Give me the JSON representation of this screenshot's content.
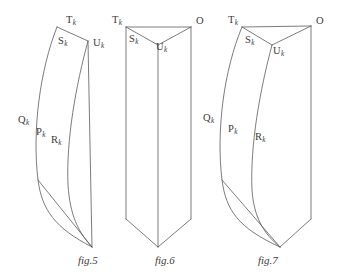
{
  "page": {
    "width": 343,
    "height": 280,
    "background": "#ffffff",
    "stroke_color": "#5a5a5a",
    "text_color": "#3b3b3b"
  },
  "figures": [
    {
      "caption": "fig.5",
      "caption_pos": {
        "x": 78,
        "y": 255
      },
      "description": "curved tapering prism converging to a point at the bottom",
      "labels": [
        {
          "name": "T",
          "sub": "k",
          "x": 66,
          "y": 15
        },
        {
          "name": "S",
          "sub": "k",
          "x": 58,
          "y": 36
        },
        {
          "name": "U",
          "sub": "k",
          "x": 93,
          "y": 38
        },
        {
          "name": "Q",
          "sub": "k",
          "x": 18,
          "y": 115
        },
        {
          "name": "P",
          "sub": "k",
          "x": 36,
          "y": 127
        },
        {
          "name": "R",
          "sub": "k",
          "x": 51,
          "y": 135
        }
      ]
    },
    {
      "caption": "fig.6",
      "caption_pos": {
        "x": 155,
        "y": 255
      },
      "description": "straight vertical triangular prism with V-shaped top and bottom",
      "labels": [
        {
          "name": "T",
          "sub": "k",
          "x": 112,
          "y": 15
        },
        {
          "name": "S",
          "sub": "k",
          "x": 129,
          "y": 34
        },
        {
          "name": "U",
          "sub": "k",
          "x": 156,
          "y": 42
        },
        {
          "name": "O",
          "sub": "",
          "x": 196,
          "y": 16
        }
      ]
    },
    {
      "caption": "fig.7",
      "caption_pos": {
        "x": 258,
        "y": 255
      },
      "description": "curved triangular prism with bowed left and middle edges",
      "labels": [
        {
          "name": "T",
          "sub": "k",
          "x": 228,
          "y": 15
        },
        {
          "name": "S",
          "sub": "k",
          "x": 245,
          "y": 35
        },
        {
          "name": "U",
          "sub": "k",
          "x": 273,
          "y": 46
        },
        {
          "name": "O",
          "sub": "",
          "x": 316,
          "y": 16
        },
        {
          "name": "Q",
          "sub": "k",
          "x": 203,
          "y": 113
        },
        {
          "name": "P",
          "sub": "k",
          "x": 228,
          "y": 124
        },
        {
          "name": "R",
          "sub": "k",
          "x": 255,
          "y": 132
        }
      ]
    }
  ],
  "geometry": {
    "fig5": {
      "left_edge": "M 57,27 C 40,70 32,130 38,180 C 42,210 55,228 92,247",
      "mid_edge": "M 57,27 L 88,41",
      "mid_curve": "M 88,41 C 76,85 66,140 68,185 C 70,215 78,232 92,247",
      "right_edge": "M 88,41 L 92,247",
      "bottom_left": "M 38,180 L 92,247"
    },
    "fig6": {
      "top_left_to_apex": "M 126,27 L 158,45",
      "apex_to_right": "M 158,45 L 191,27",
      "top_ridge": "M 126,27 L 191,27",
      "left_edge": "M 126,27 L 126,219",
      "mid_edge": "M 158,45 L 158,247",
      "right_edge": "M 191,27 L 191,219",
      "bottom_left": "M 126,219 L 158,247",
      "bottom_right": "M 158,247 L 191,219"
    },
    "fig7": {
      "top_ridge": "M 242,27 L 311,26",
      "top_left_to_apex": "M 242,27 L 272,45",
      "apex_to_right": "M 272,45 L 311,26",
      "left_edge": "M 242,27 C 224,70 216,130 222,180 C 226,210 238,228 280,247",
      "mid_edge": "M 272,45 C 260,90 250,145 252,190 C 254,218 264,234 280,247",
      "right_edge": "M 311,26 L 311,219",
      "bottom_left": "M 222,180 L 280,247",
      "bottom_right": "M 280,247 L 311,219"
    }
  }
}
